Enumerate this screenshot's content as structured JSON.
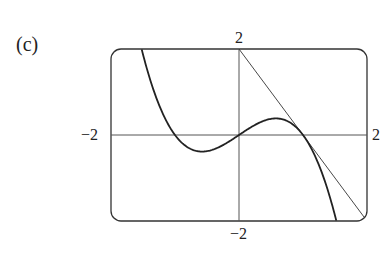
{
  "panel_label": "(c)",
  "chart_data": {
    "type": "line",
    "title": "",
    "xlabel": "",
    "ylabel": "",
    "xlim": [
      -2,
      2
    ],
    "ylim": [
      -2,
      2
    ],
    "grid": false,
    "axes_through_origin": true,
    "tick_labels": {
      "x_min": "−2",
      "x_max": "2",
      "y_min": "−2",
      "y_max": "2"
    },
    "series": [
      {
        "name": "curve",
        "description": "cubic y = x − x^3",
        "style": "thick",
        "points": [
          [
            -1.52,
            2.0
          ],
          [
            -1.2,
            0.53
          ],
          [
            -1.0,
            0.0
          ],
          [
            -0.577,
            -0.385
          ],
          [
            0.0,
            0.0
          ],
          [
            0.577,
            0.385
          ],
          [
            1.0,
            0.0
          ],
          [
            1.2,
            -0.53
          ],
          [
            1.52,
            -2.0
          ]
        ]
      },
      {
        "name": "tangent-line",
        "description": "tangent at x = 1: y = −2x + 2",
        "style": "thin",
        "points": [
          [
            0.0,
            2.0
          ],
          [
            2.0,
            -2.0
          ]
        ]
      }
    ],
    "annotations": [
      "tangent touches curve at (1, 0)"
    ]
  }
}
